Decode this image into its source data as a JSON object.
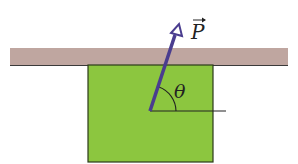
{
  "diagram": {
    "labels": {
      "force": "P",
      "angle": "θ"
    },
    "colors": {
      "ceiling": "#bfa6a0",
      "ceiling_edge": "#3a3a3a",
      "block": "#8cc63f",
      "block_edge": "#2b3a1a",
      "arrow": "#4a3d8f",
      "line": "#222222"
    }
  }
}
